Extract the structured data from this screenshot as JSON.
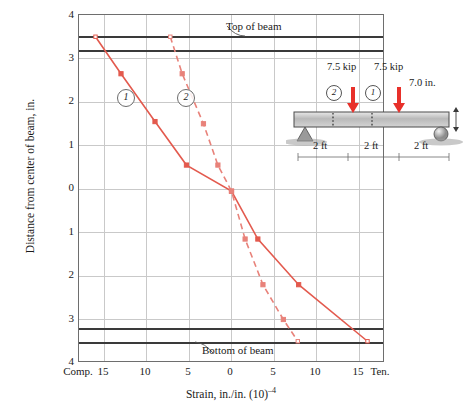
{
  "chart_data": {
    "type": "line",
    "title": "",
    "xlabel": "Strain, in./in. (10)⁻⁴",
    "ylabel": "Distance from center of beam, in.",
    "xlim": [
      -18,
      18
    ],
    "ylim": [
      -4,
      4
    ],
    "y_inverted": true,
    "grid": true,
    "legend_position": "inline-callout",
    "x_tick_labels": [
      "Comp.",
      "15",
      "10",
      "5",
      "0",
      "5",
      "10",
      "15",
      "Ten."
    ],
    "x_tick_values": [
      -18.5,
      -15,
      -10,
      -5,
      0,
      5,
      10,
      15,
      18.5
    ],
    "y_tick_labels": [
      "4",
      "3",
      "2",
      "1",
      "0",
      "1",
      "2",
      "3",
      "4"
    ],
    "y_tick_values": [
      4,
      3,
      2,
      1,
      0,
      -1,
      -2,
      -3,
      -4
    ],
    "reference_lines": [
      {
        "name": "Top of beam",
        "y": 3.5
      },
      {
        "name": "top-inner",
        "y": 3.2
      },
      {
        "name": "bottom-inner",
        "y": -3.2
      },
      {
        "name": "Bottom of beam",
        "y": -3.5
      }
    ],
    "annotations": [
      {
        "text": "Top of beam",
        "target_y": 3.5
      },
      {
        "text": "Bottom of beam",
        "target_y": -3.5
      }
    ],
    "series": [
      {
        "name": "1",
        "label": "①",
        "style": "solid",
        "color": "#e35a4e",
        "points": [
          {
            "x": -16.0,
            "y": 3.5
          },
          {
            "x": -13.0,
            "y": 2.65
          },
          {
            "x": -9.0,
            "y": 1.55
          },
          {
            "x": -5.3,
            "y": 0.55
          },
          {
            "x": 0.0,
            "y": -0.05
          },
          {
            "x": 3.1,
            "y": -1.15
          },
          {
            "x": 7.9,
            "y": -2.2
          },
          {
            "x": 16.0,
            "y": -3.5
          }
        ]
      },
      {
        "name": "2",
        "label": "②",
        "style": "dashed",
        "color": "#e8827a",
        "points": [
          {
            "x": -7.2,
            "y": 3.5
          },
          {
            "x": -5.8,
            "y": 2.65
          },
          {
            "x": -3.3,
            "y": 1.5
          },
          {
            "x": -1.6,
            "y": 0.55
          },
          {
            "x": 0.0,
            "y": -0.05
          },
          {
            "x": 1.6,
            "y": -1.15
          },
          {
            "x": 3.7,
            "y": -2.2
          },
          {
            "x": 6.1,
            "y": -3.0
          },
          {
            "x": 7.8,
            "y": -3.5
          }
        ]
      }
    ]
  },
  "annotations": {
    "top_of_beam": "Top of beam",
    "bottom_of_beam": "Bottom of beam",
    "curve_1": "1",
    "curve_2": "2"
  },
  "beam_diagram": {
    "load_left_label": "7.5 kip",
    "load_right_label": "7.5 kip",
    "gage_left_label": "2",
    "gage_right_label": "1",
    "depth_label": "7.0 in.",
    "span_1": "2 ft",
    "span_2": "2 ft",
    "span_3": "2 ft"
  },
  "colors": {
    "curve_solid": "#e35a4e",
    "curve_dashed": "#e8827a",
    "beam_line": "#3a3a3a",
    "grid": "#c9c9c9",
    "frame": "#6e6e6e",
    "load_arrow": "#e8302a"
  }
}
